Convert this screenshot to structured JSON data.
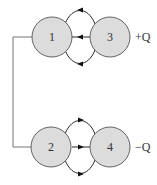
{
  "diagram": {
    "type": "electrostatic-induction-spheres",
    "colors": {
      "sphere_fill": "#dcdcdc",
      "stroke": "#555555",
      "wire": "#777777",
      "arrow": "#111111"
    },
    "spheres": [
      {
        "id": "1",
        "label": "1"
      },
      {
        "id": "3",
        "label": "3"
      },
      {
        "id": "2",
        "label": "2"
      },
      {
        "id": "4",
        "label": "4"
      }
    ],
    "charges": {
      "top": "+Q",
      "bottom": "−Q"
    },
    "connections": [
      {
        "from": "1",
        "to": "2",
        "kind": "wire"
      }
    ],
    "field_arrows": [
      {
        "between": "3→1",
        "direction": "left",
        "count": 3
      },
      {
        "between": "2→4",
        "direction": "right",
        "count": 3
      }
    ]
  }
}
